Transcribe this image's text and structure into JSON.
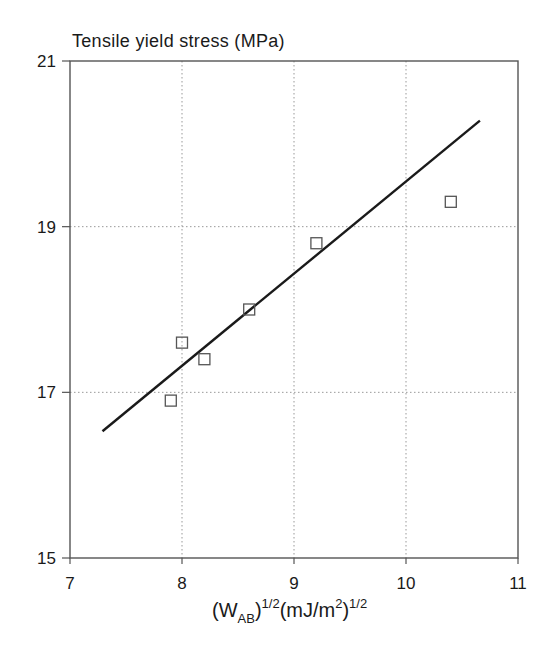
{
  "chart_data": {
    "type": "scatter",
    "title": "Tensile yield stress (MPa)",
    "xlabel": "(W_AB)^1/2 (mJ/m^2)^1/2",
    "xlabel_parts": {
      "open": "(W",
      "sub": "AB",
      "close": ")",
      "sup1": "1/2",
      "mid": "(mJ/m",
      "sup2": "2",
      "close2": ")",
      "sup3": "1/2"
    },
    "ylabel": "Tensile yield stress (MPa)",
    "xlim": [
      7,
      11
    ],
    "ylim": [
      15,
      21
    ],
    "xticks": [
      7,
      8,
      9,
      10,
      11
    ],
    "yticks": [
      15,
      17,
      19,
      21
    ],
    "grid": true,
    "grid_style": "dotted",
    "legend": null,
    "series": [
      {
        "name": "measured",
        "marker": "open-square",
        "points": [
          {
            "x": 7.9,
            "y": 16.9
          },
          {
            "x": 8.0,
            "y": 17.6
          },
          {
            "x": 8.2,
            "y": 17.4
          },
          {
            "x": 8.6,
            "y": 18.0
          },
          {
            "x": 9.2,
            "y": 18.8
          },
          {
            "x": 10.4,
            "y": 19.3
          }
        ]
      },
      {
        "name": "linear fit",
        "type": "line",
        "points": [
          {
            "x": 7.29,
            "y": 16.53
          },
          {
            "x": 10.66,
            "y": 20.28
          }
        ]
      }
    ]
  },
  "colors": {
    "axis": "#555555",
    "grid": "#999999",
    "line": "#1a1a1a",
    "marker": "#555555"
  }
}
